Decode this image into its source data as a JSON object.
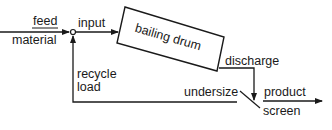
{
  "diagram": {
    "title": "",
    "nodes": {
      "feed_material": {
        "label_line1": "feed",
        "label_line2": "material"
      },
      "input": {
        "label": "input"
      },
      "bailing_drum": {
        "label": "bailing drum"
      },
      "discharge": {
        "label": "discharge"
      },
      "screen": {
        "label": "screen"
      },
      "undersize": {
        "label": "undersize"
      },
      "product": {
        "label": "product"
      },
      "recycle_load": {
        "label_line1": "recycle",
        "label_line2": "load"
      }
    },
    "edges": [
      {
        "from": "feed material",
        "to": "junction"
      },
      {
        "from": "junction",
        "to": "bailing drum",
        "label": "input"
      },
      {
        "from": "bailing drum",
        "to": "screen",
        "label": "discharge"
      },
      {
        "from": "screen",
        "to": "product",
        "label": "product"
      },
      {
        "from": "screen",
        "to": "junction",
        "label": "undersize / recycle load"
      }
    ],
    "colors": {
      "line": "#1a1a1a",
      "background": "#ffffff"
    }
  }
}
